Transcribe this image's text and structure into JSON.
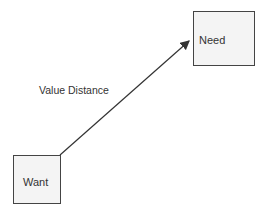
{
  "diagram": {
    "nodes": [
      {
        "id": "need",
        "label": "Need"
      },
      {
        "id": "want",
        "label": "Want"
      }
    ],
    "edges": [
      {
        "from": "want",
        "to": "need",
        "label": "Value Distance"
      }
    ]
  }
}
